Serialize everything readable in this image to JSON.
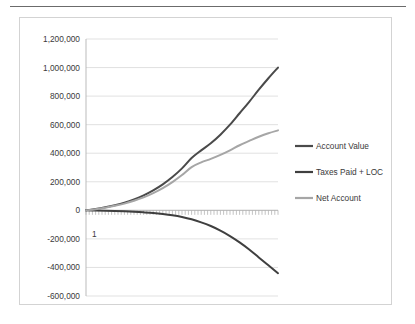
{
  "document": {
    "top_rule": true
  },
  "chart_data": {
    "type": "line",
    "title": "",
    "subtitle": "",
    "xlabel": "",
    "ylabel": "",
    "grid": true,
    "legend_position": "right",
    "ylim": [
      -600000,
      1200000
    ],
    "ytick_labels": [
      "1,200,000",
      "1,000,000",
      "800,000",
      "600,000",
      "400,000",
      "200,000",
      "0",
      "-200,000",
      "-400,000",
      "-600,000"
    ],
    "ytick_values": [
      1200000,
      1000000,
      800000,
      600000,
      400000,
      200000,
      0,
      -200000,
      -400000,
      -600000
    ],
    "xtick_labels": [
      "1"
    ],
    "xlim": [
      0,
      40
    ],
    "x": [
      0,
      2,
      4,
      6,
      8,
      10,
      12,
      14,
      16,
      18,
      20,
      22,
      24,
      26,
      28,
      30,
      32,
      34,
      36,
      38,
      40
    ],
    "series": [
      {
        "name": "Account Value",
        "color": "#4a4a4a",
        "width": 2.0,
        "values": [
          0,
          9000,
          21000,
          36000,
          54000,
          77000,
          105000,
          140000,
          182000,
          233000,
          294000,
          366000,
          420000,
          470000,
          530000,
          600000,
          680000,
          760000,
          845000,
          925000,
          1000000
        ]
      },
      {
        "name": "Taxes Paid + LOC",
        "color": "#3f3f3f",
        "width": 2.0,
        "values": [
          0,
          -1000,
          -2500,
          -4500,
          -7000,
          -10000,
          -14000,
          -19000,
          -26000,
          -35000,
          -47000,
          -63000,
          -84000,
          -110000,
          -142000,
          -180000,
          -224000,
          -274000,
          -330000,
          -385000,
          -440000
        ]
      },
      {
        "name": "Net Account",
        "color": "#a6a6a6",
        "width": 2.0,
        "values": [
          0,
          8000,
          18500,
          31500,
          47000,
          67000,
          91000,
          121000,
          156000,
          198000,
          247000,
          303000,
          336000,
          360000,
          388000,
          420000,
          456000,
          486000,
          515000,
          540000,
          560000
        ]
      }
    ],
    "legend": [
      {
        "label": "Account Value",
        "color": "#4a4a4a"
      },
      {
        "label": "Taxes Paid + LOC",
        "color": "#3f3f3f"
      },
      {
        "label": "Net Account",
        "color": "#a6a6a6"
      }
    ]
  }
}
